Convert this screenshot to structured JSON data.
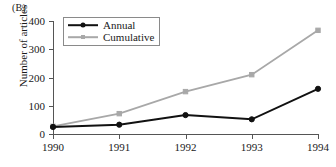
{
  "figure": {
    "panel_label": "(B)"
  },
  "axes": {
    "y_title": "Number of articles",
    "y_ticks": [
      "0",
      "100",
      "200",
      "300",
      "400"
    ],
    "x_ticks": [
      "1990",
      "1991",
      "1992",
      "1993",
      "1994"
    ]
  },
  "legend": {
    "items": [
      {
        "label": "Annual",
        "color": "#111111",
        "marker": "circle-marker"
      },
      {
        "label": "Cumulative",
        "color": "#a8a8a8",
        "marker": "square-marker"
      }
    ]
  },
  "chart_data": {
    "type": "line",
    "title": "(B)",
    "xlabel": "",
    "ylabel": "Number of articles",
    "x": [
      1990,
      1991,
      1992,
      1993,
      1994
    ],
    "categories": [
      "1990",
      "1991",
      "1992",
      "1993",
      "1994"
    ],
    "xlim": [
      1990,
      1994
    ],
    "ylim": [
      0,
      400
    ],
    "ytick_values": [
      0,
      100,
      200,
      300,
      400
    ],
    "grid": false,
    "legend_position": "upper-left-inside",
    "series": [
      {
        "name": "Annual",
        "color": "#111111",
        "marker": "circle",
        "values": [
          25,
          33,
          67,
          52,
          160
        ]
      },
      {
        "name": "Cumulative",
        "color": "#a8a8a8",
        "marker": "square",
        "values": [
          27,
          72,
          150,
          210,
          367
        ]
      }
    ]
  }
}
